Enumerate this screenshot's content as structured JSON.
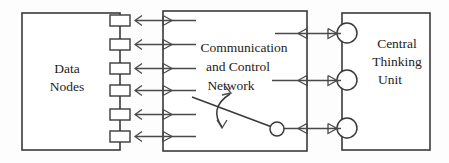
{
  "diagram": {
    "background_color": "#fdfdfd",
    "line_color": "#3a3a3a",
    "blocks": [
      {
        "id": "data-nodes",
        "lines": [
          "Data",
          "Nodes"
        ],
        "line1": "Data",
        "line2": "Nodes",
        "port_count": 6,
        "port_shape": "rectangle"
      },
      {
        "id": "communication-and-control-network",
        "lines": [
          "Communication",
          "and Control",
          "Network"
        ],
        "line1": "Communication",
        "line2": "and Control",
        "line3": "Network",
        "port_count": 0,
        "port_shape": "none"
      },
      {
        "id": "central-thinking-unit",
        "lines": [
          "Central",
          "Thinking",
          "Unit"
        ],
        "line1": "Central",
        "line2": "Thinking",
        "line3": "Unit",
        "port_count": 3,
        "port_shape": "circle"
      }
    ],
    "connections": {
      "left_bus_count": 6,
      "left_bus_description": "bidirectional links between Data Nodes ports and Communication and Control Network",
      "right_bus_count": 3,
      "right_bus_description": "bidirectional links between Communication and Control Network and Central Thinking Unit circles",
      "internal_link_description": "diagonal switch link with rotation arrow inside the network block"
    }
  }
}
